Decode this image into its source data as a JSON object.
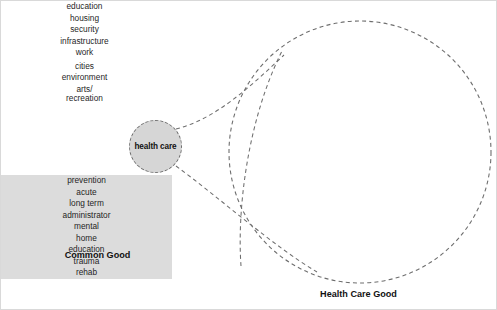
{
  "figure": {
    "background_color": "#ffffff",
    "frame_color": "#d9d9d9"
  },
  "common_good": {
    "caption": "Common Good",
    "grid_rows": 3,
    "grid_cols": 3,
    "cell_fill": "#ffffff",
    "line_color": "#3b3b3b",
    "cells": [
      {
        "label": "education",
        "highlighted": false
      },
      {
        "label": "housing",
        "highlighted": false
      },
      {
        "label": "security",
        "highlighted": false
      },
      {
        "label": "infrastructure",
        "highlighted": false
      },
      {
        "label": "work",
        "highlighted": false
      },
      {
        "label": "health care",
        "highlighted": true
      },
      {
        "label": "cities",
        "highlighted": false
      },
      {
        "label": "environment",
        "highlighted": false
      },
      {
        "label": "arts/\nrecreation",
        "highlighted": false
      }
    ]
  },
  "highlight_bubble": {
    "label": "health care",
    "fill": "#d6d6d6",
    "stroke": "#6e6e6e",
    "stroke_style": "dashed"
  },
  "health_care_good": {
    "caption": "Health Care Good",
    "grid_rows": 3,
    "grid_cols": 3,
    "cell_fill": "#dcdcdc",
    "line_color": "#3b3b3b",
    "cells": [
      {
        "label": "prevention"
      },
      {
        "label": "acute"
      },
      {
        "label": "long term"
      },
      {
        "label": "administrator"
      },
      {
        "label": "mental"
      },
      {
        "label": "home"
      },
      {
        "label": "education"
      },
      {
        "label": "trauma"
      },
      {
        "label": "rehab"
      }
    ],
    "enclosing_circle": {
      "stroke": "#6e6e6e",
      "stroke_style": "dashed",
      "center_x": 359,
      "center_y": 151,
      "radius": 131
    }
  },
  "connectors": [
    {
      "name": "upper-magnifier-line",
      "from_x": 175,
      "from_y": 128,
      "to_x": 283,
      "to_y": 54,
      "style": "dashed"
    },
    {
      "name": "lower-magnifier-line",
      "from_x": 175,
      "from_y": 165,
      "to_x": 315,
      "to_y": 271,
      "style": "dashed"
    }
  ]
}
